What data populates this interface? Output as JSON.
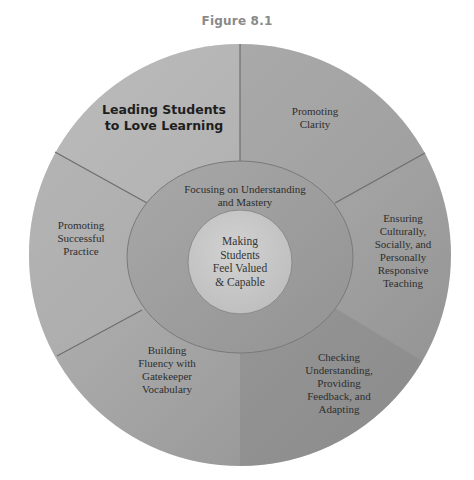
{
  "figure": {
    "title": "Figure 8.1"
  },
  "colors": {
    "background": "#ffffff",
    "outer_light": "#b8b8b8",
    "outer_mid": "#a3a3a3",
    "outer_dark": "#909090",
    "ring": "#9c9c9c",
    "core": "#c9c9c9",
    "divider": "#6e6e6e",
    "text": "#2e2e2e"
  },
  "diagram": {
    "core": {
      "label": "Making\nStudents\nFeel Valued\n& Capable"
    },
    "ring": {
      "label": "Focusing on Understanding\nand Mastery"
    },
    "segments": [
      {
        "id": "leading",
        "label": "Leading Students\nto Love Learning",
        "emphasis": true
      },
      {
        "id": "clarity",
        "label": "Promoting\nClarity"
      },
      {
        "id": "responsive",
        "label": "Ensuring\nCulturally,\nSocially, and\nPersonally\nResponsive\nTeaching"
      },
      {
        "id": "checking",
        "label": "Checking\nUnderstanding,\nProviding\nFeedback, and\nAdapting"
      },
      {
        "id": "vocabulary",
        "label": "Building\nFluency with\nGatekeeper\nVocabulary"
      },
      {
        "id": "practice",
        "label": "Promoting\nSuccessful\nPractice"
      }
    ]
  }
}
